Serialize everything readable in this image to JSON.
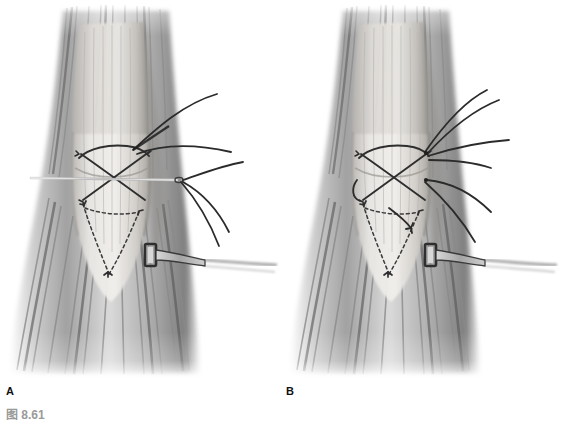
{
  "figure": {
    "caption": "图 8.61",
    "caption_color": "#9a9a9a",
    "background_color": "#ffffff",
    "illustration_type": "grayscale surgical anatomy line-and-wash illustration",
    "width": 562,
    "height": 434
  },
  "panels": [
    {
      "id": "A",
      "label": "A",
      "label_x": 6,
      "label_y": 386,
      "center_x": 140,
      "description": "Tendon with crossed X suture, straight needle passed transversely, four suture strands exiting right, dashed deep sutures distally, retractor engaging the tendon edge",
      "elements": {
        "muscle_belly": "striated muscle fibers radiating proximally and distally",
        "tendon": "pale central tendon with vertical fiber striations",
        "suture_pattern": "crossed X stitch with horizontal straight needle",
        "needle": "straight suture needle passing transverse across tendon",
        "free_strands": 4,
        "deep_sutures": "dashed/stippled V-shaped deep sutures",
        "retractor": "rectangular-blade retractor on right tendon margin"
      }
    },
    {
      "id": "B",
      "label": "B",
      "label_x": 286,
      "label_y": 386,
      "center_x": 420,
      "description": "Same tendon repair after needle removal; six suture strands converge and exit right, additional hooked suture loop at mid-tendon, dashed deep sutures distally, retractor in place",
      "elements": {
        "muscle_belly": "striated muscle fibers radiating proximally and distally",
        "tendon": "pale central tendon with vertical fiber striations",
        "suture_pattern": "crossed X stitch, needle withdrawn",
        "needle": "none",
        "free_strands": 6,
        "deep_sutures": "dashed/stippled V-shaped deep sutures with extra hooked loop",
        "retractor": "rectangular-blade retractor on right tendon margin"
      }
    }
  ],
  "colors": {
    "suture_dark": "#2e2e2e",
    "suture_mid": "#4a4a4a",
    "tendon_light": "#e6e4e1",
    "tendon_mid": "#cfcbc6",
    "muscle_dark": "#6a6a6a",
    "muscle_mid": "#9b9b9b",
    "muscle_light": "#d6d6d6",
    "needle_steel": "#b9b9b9",
    "retractor_dark": "#3b3b3b",
    "label_black": "#111111"
  }
}
